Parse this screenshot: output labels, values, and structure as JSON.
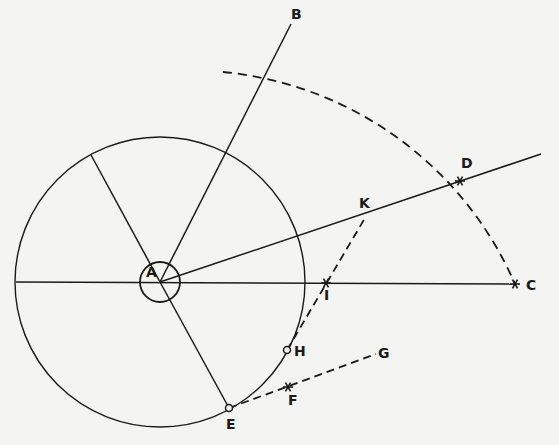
{
  "diagram": {
    "type": "geometric-construction",
    "colors": {
      "background": "#f4f4f2",
      "ink": "#1a1a1a"
    },
    "points": {
      "A": {
        "label": "A",
        "x": 160,
        "y": 282,
        "lx": 146,
        "ly": 277
      },
      "B": {
        "label": "B",
        "x": 291,
        "y": 24,
        "lx": 291,
        "ly": 19
      },
      "C": {
        "label": "C",
        "x": 515,
        "y": 284,
        "lx": 526,
        "ly": 290
      },
      "D": {
        "label": "D",
        "x": 460,
        "y": 181,
        "lx": 461,
        "ly": 168
      },
      "E": {
        "label": "E",
        "x": 229,
        "y": 408,
        "lx": 226,
        "ly": 429
      },
      "F": {
        "label": "F",
        "x": 288,
        "y": 387,
        "lx": 288,
        "ly": 405
      },
      "G": {
        "label": "G",
        "x": 376,
        "y": 354,
        "lx": 378,
        "ly": 358
      },
      "H": {
        "label": "H",
        "x": 287,
        "y": 350,
        "lx": 294,
        "ly": 356
      },
      "I": {
        "label": "I",
        "x": 326,
        "y": 283,
        "lx": 324,
        "ly": 300
      },
      "K": {
        "label": "K",
        "x": 365,
        "y": 218,
        "lx": 359,
        "ly": 208
      }
    },
    "circles": [
      {
        "name": "main-circle",
        "cx": 160,
        "cy": 282,
        "r": 145
      },
      {
        "name": "center-small-circle",
        "cx": 160,
        "cy": 282,
        "r": 20
      }
    ],
    "arc": {
      "name": "dashed-arc-CD",
      "center": "A",
      "r": 355,
      "from": [
        223,
        72
      ],
      "to": [
        515,
        284
      ]
    },
    "solid_lines": [
      {
        "name": "diameter-horizontal",
        "from": [
          16,
          282
        ],
        "to": [
          515,
          284
        ]
      },
      {
        "name": "ray-AB",
        "from": [
          160,
          282
        ],
        "to": [
          291,
          24
        ]
      },
      {
        "name": "ray-AD",
        "from": [
          160,
          282
        ],
        "to": [
          541,
          154
        ]
      },
      {
        "name": "radius-upper-left",
        "from": [
          160,
          282
        ],
        "to": [
          91,
          155
        ]
      },
      {
        "name": "radius-AE",
        "from": [
          160,
          282
        ],
        "to": [
          229,
          408
        ]
      }
    ],
    "dashed_lines": [
      {
        "name": "line-EG",
        "from": [
          229,
          408
        ],
        "to": [
          376,
          354
        ]
      },
      {
        "name": "line-HK",
        "from": [
          287,
          350
        ],
        "to": [
          365,
          218
        ]
      }
    ],
    "markers": {
      "star": [
        "C",
        "D",
        "I",
        "F"
      ],
      "open_circle": [
        "E",
        "H"
      ]
    }
  }
}
